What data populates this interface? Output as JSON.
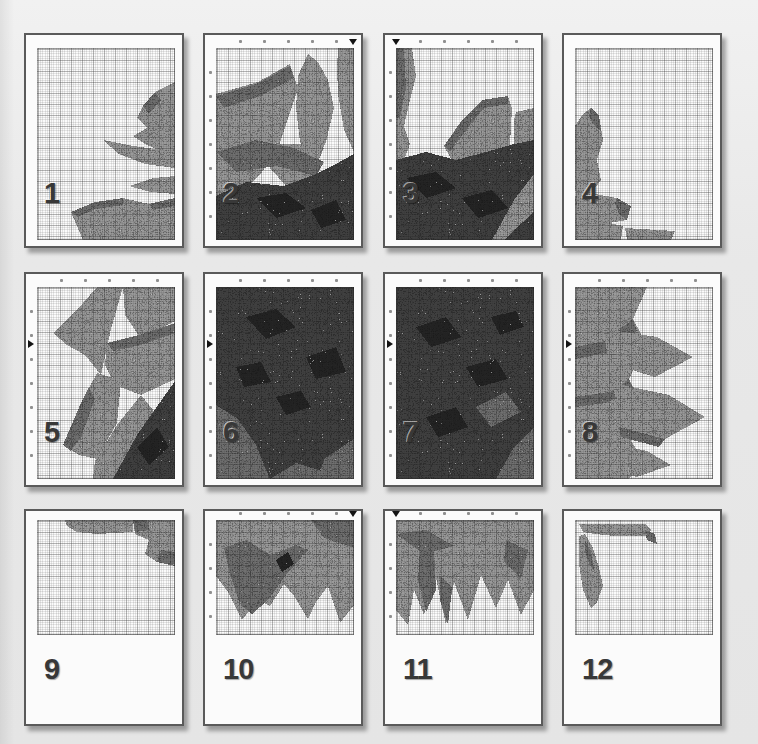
{
  "figure": {
    "kind": "cross-stitch pattern print-layout preview, sunflower motif split over 12 pages",
    "background_color": "#e8e8e8",
    "page_background": "#fbfbfb",
    "page_border_color": "#5a5a5a",
    "grid_major_color": "rgba(40,40,40,0.26)",
    "grid_minor_color": "rgba(40,40,40,0.11)",
    "number_color": "#383838",
    "marker_color": "#141414"
  },
  "palette": {
    "petal": "#9a9a9a",
    "petal_dark": "#6f6f6f",
    "center": "#3f3f3f",
    "center_black": "#242424"
  },
  "pages": [
    {
      "number": "1",
      "row": 1,
      "col": 1,
      "ticks": false,
      "marker": null,
      "shapes": [
        {
          "fill": "petal",
          "points": "138,34 118,44 106,58 100,70 110,80 96,88 108,96 122,102 138,106"
        },
        {
          "fill": "petal_dark",
          "points": "118,44 106,58 112,66 124,52"
        },
        {
          "fill": "petal",
          "points": "66,92 96,98 124,102 138,106 138,120 108,116 82,106"
        },
        {
          "fill": "petal",
          "points": "92,138 116,130 138,128 138,146 114,144"
        },
        {
          "fill": "petal",
          "points": "34,164 58,154 86,150 112,156 138,150 138,192 46,192"
        },
        {
          "fill": "petal_dark",
          "points": "34,164 58,154 86,150 86,157 58,161 41,169"
        },
        {
          "fill": "petal_dark",
          "points": "112,156 138,150 138,158 116,162"
        }
      ]
    },
    {
      "number": "2",
      "row": 1,
      "col": 2,
      "ticks": true,
      "marker": "top-right",
      "shapes": [
        {
          "fill": "petal",
          "points": "0,46 42,34 74,16 82,40 64,95 46,124 20,150 0,160"
        },
        {
          "fill": "petal",
          "points": "82,28 92,6 102,14 112,32 118,60 110,94 96,120 84,94 80,60"
        },
        {
          "fill": "petal",
          "points": "122,0 138,0 138,104 128,82 122,46 121,20"
        },
        {
          "fill": "petal",
          "points": "58,96 84,96 108,100 96,128 70,138 54,120"
        },
        {
          "fill": "petal_dark",
          "points": "0,48 40,36 74,18 78,30 44,48 8,60"
        },
        {
          "fill": "petal_dark",
          "points": "0,104 40,92 78,100 108,114 100,128 60,118 20,124"
        },
        {
          "fill": "center",
          "points": "0,148 30,134 68,138 100,126 120,116 138,106 138,192 0,192"
        },
        {
          "fill": "center_black",
          "points": "40,150 70,145 90,160 60,170"
        },
        {
          "fill": "center_black",
          "points": "95,162 120,152 130,172 105,180"
        }
      ]
    },
    {
      "number": "3",
      "row": 1,
      "col": 3,
      "ticks": true,
      "marker": "top-left",
      "shapes": [
        {
          "fill": "petal",
          "points": "0,0 16,0 20,28 14,52 8,78 14,96 8,112 0,112"
        },
        {
          "fill": "petal_dark",
          "points": "0,0 8,0 10,40 4,70 0,70"
        },
        {
          "fill": "petal",
          "points": "48,98 66,72 86,52 112,48 116,60 114,96 100,116 58,116"
        },
        {
          "fill": "petal_dark",
          "points": "48,98 66,72 86,52 112,48 112,56 88,60 70,82 54,104"
        },
        {
          "fill": "petal",
          "points": "120,64 138,60 138,116 118,96 118,72"
        },
        {
          "fill": "center",
          "points": "0,112 30,104 60,112 90,104 118,96 138,92 138,192 0,192"
        },
        {
          "fill": "petal",
          "points": "96,192 118,152 138,126 138,164 116,184 108,192"
        },
        {
          "fill": "center_black",
          "points": "10,130 40,124 60,140 30,150"
        },
        {
          "fill": "center_black",
          "points": "66,150 96,142 112,160 82,170"
        }
      ]
    },
    {
      "number": "4",
      "row": 1,
      "col": 4,
      "ticks": false,
      "marker": null,
      "shapes": [
        {
          "fill": "petal",
          "points": "16,60 24,68 28,92 22,112 26,132 14,148 2,150 0,140 0,78 8,66"
        },
        {
          "fill": "petal_dark",
          "points": "16,60 24,68 26,84 18,76 14,68"
        },
        {
          "fill": "petal",
          "points": "0,148 20,146 42,150 56,158 52,172 28,176 0,176"
        },
        {
          "fill": "petal_dark",
          "points": "42,150 56,158 52,172 44,166 40,156"
        },
        {
          "fill": "petal",
          "points": "0,176 30,174 48,178 46,192 0,192"
        },
        {
          "fill": "petal",
          "points": "50,180 100,183 96,192 52,192"
        }
      ]
    },
    {
      "number": "5",
      "row": 2,
      "col": 1,
      "ticks": true,
      "marker": "left",
      "shapes": [
        {
          "fill": "petal",
          "points": "16,46 46,16 60,0 86,0 74,42 64,88 48,68 30,58"
        },
        {
          "fill": "petal",
          "points": "86,0 138,0 138,34 104,52 88,28"
        },
        {
          "fill": "petal",
          "points": "70,56 102,48 138,36 138,92 104,108 78,98 68,78"
        },
        {
          "fill": "petal_dark",
          "points": "70,56 102,48 138,36 138,46 104,58 76,64"
        },
        {
          "fill": "petal",
          "points": "26,158 44,116 60,86 84,94 80,136 60,172 42,168"
        },
        {
          "fill": "petal_dark",
          "points": "26,158 44,116 52,100 58,112 44,150 34,164"
        },
        {
          "fill": "petal",
          "points": "58,174 80,138 104,108 120,128 100,168 82,192 56,192"
        },
        {
          "fill": "center",
          "points": "76,192 100,148 138,94 138,192"
        },
        {
          "fill": "center_black",
          "points": "100,160 120,140 132,160 112,178"
        }
      ]
    },
    {
      "number": "6",
      "row": 2,
      "col": 2,
      "ticks": true,
      "marker": "left",
      "shapes": [
        {
          "fill": "center",
          "points": "0,0 138,0 138,192 0,192"
        },
        {
          "fill": "petal_dark",
          "points": "0,118 22,132 40,158 54,192 0,192"
        },
        {
          "fill": "petal_dark",
          "points": "54,192 80,176 112,186 104,192"
        },
        {
          "fill": "petal_dark",
          "points": "108,172 138,152 138,192 102,192"
        },
        {
          "fill": "center_black",
          "points": "30,30 60,22 80,40 50,52"
        },
        {
          "fill": "center_black",
          "points": "90,70 120,60 130,85 100,92"
        },
        {
          "fill": "center_black",
          "points": "20,80 45,75 55,95 28,100"
        },
        {
          "fill": "center_black",
          "points": "60,110 85,104 95,120 70,128"
        }
      ]
    },
    {
      "number": "7",
      "row": 2,
      "col": 3,
      "ticks": true,
      "marker": "left",
      "shapes": [
        {
          "fill": "center",
          "points": "0,0 138,0 138,192 0,192"
        },
        {
          "fill": "petal_dark",
          "points": "100,192 118,160 138,140 138,192"
        },
        {
          "fill": "petal_dark",
          "points": "80,120 110,105 125,125 95,140"
        },
        {
          "fill": "center_black",
          "points": "20,40 50,30 65,50 35,60"
        },
        {
          "fill": "center_black",
          "points": "70,80 100,72 112,92 82,100"
        },
        {
          "fill": "center_black",
          "points": "30,130 60,120 72,140 42,150"
        },
        {
          "fill": "center_black",
          "points": "95,30 120,24 128,40 104,48"
        }
      ]
    },
    {
      "number": "8",
      "row": 2,
      "col": 4,
      "ticks": true,
      "marker": "left",
      "shapes": [
        {
          "fill": "petal",
          "points": "0,0 72,0 58,32 72,58 54,92 68,118 52,148 68,172 54,192 0,192"
        },
        {
          "fill": "petal_dark",
          "points": "0,60 30,54 58,32 62,44 30,66 0,72"
        },
        {
          "fill": "petal_dark",
          "points": "0,110 40,104 54,92 58,104 30,116 0,120"
        },
        {
          "fill": "petal",
          "points": "28,42 82,50 118,70 80,90 34,76"
        },
        {
          "fill": "petal",
          "points": "38,96 94,108 130,130 90,152 44,140"
        },
        {
          "fill": "petal_dark",
          "points": "44,140 90,152 84,160 46,150"
        },
        {
          "fill": "petal",
          "points": "34,156 72,164 96,178 62,190 36,184"
        }
      ]
    },
    {
      "number": "9",
      "row": 3,
      "col": 1,
      "ticks": false,
      "marker": null,
      "shapes": [
        {
          "fill": "petal",
          "points": "28,0 96,0 96,12 60,14 40,12 30,6"
        },
        {
          "fill": "petal",
          "points": "96,0 138,0 138,46 120,42 108,34 112,20 98,14"
        },
        {
          "fill": "petal_dark",
          "points": "120,42 138,46 138,32 124,30"
        },
        {
          "fill": "petal_dark",
          "points": "96,0 110,0 112,10 98,12"
        }
      ]
    },
    {
      "number": "10",
      "row": 3,
      "col": 2,
      "ticks": true,
      "marker": "top-right",
      "shapes": [
        {
          "fill": "petal",
          "points": "0,0 138,0 138,85 124,103 112,66 100,82 92,99 78,76 68,64 54,86 42,80 26,100 12,72 0,56"
        },
        {
          "fill": "petal_dark",
          "points": "8,28 30,20 55,35 80,25 92,30 70,55 52,80 36,94 24,84 14,55"
        },
        {
          "fill": "petal_dark",
          "points": "95,0 138,0 138,28 108,18"
        },
        {
          "fill": "center_black",
          "points": "60,40 72,32 78,44 66,52"
        }
      ]
    },
    {
      "number": "11",
      "row": 3,
      "col": 3,
      "ticks": true,
      "marker": "top-left",
      "shapes": [
        {
          "fill": "petal",
          "points": "0,0 138,0 138,70 125,95 112,60 100,88 85,55 72,100 58,62 50,105 40,58 28,95 18,70 12,105 0,90"
        },
        {
          "fill": "petal_dark",
          "points": "24,28 38,30 40,70 30,92 22,60"
        },
        {
          "fill": "petal_dark",
          "points": "44,55 56,68 52,105 44,80"
        },
        {
          "fill": "petal_dark",
          "points": "0,14 28,34 58,26 30,10"
        },
        {
          "fill": "petal_dark",
          "points": "110,20 132,30 125,58 108,42"
        }
      ]
    },
    {
      "number": "12",
      "row": 3,
      "col": 4,
      "ticks": false,
      "marker": null,
      "shapes": [
        {
          "fill": "petal",
          "points": "4,4 70,4 76,10 70,16 40,16 20,14 8,12"
        },
        {
          "fill": "petal_dark",
          "points": "70,10 80,14 82,24 72,20"
        },
        {
          "fill": "petal",
          "points": "4,16 10,14 18,28 24,48 28,66 22,82 16,88 8,70 4,44"
        },
        {
          "fill": "petal_dark",
          "points": "10,20 16,32 20,52 14,44 10,30"
        }
      ]
    }
  ]
}
